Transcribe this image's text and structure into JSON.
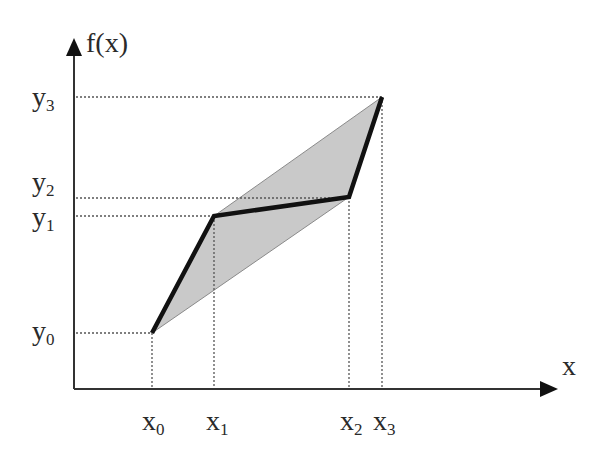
{
  "diagram": {
    "axes": {
      "y_label": "f(x)",
      "x_label": "x"
    },
    "x_ticks": [
      {
        "base": "x",
        "sub": "0",
        "px": 152
      },
      {
        "base": "x",
        "sub": "1",
        "px": 214
      },
      {
        "base": "x",
        "sub": "2",
        "px": 349
      },
      {
        "base": "x",
        "sub": "3",
        "px": 382
      }
    ],
    "y_ticks": [
      {
        "base": "y",
        "sub": "0",
        "py": 333
      },
      {
        "base": "y",
        "sub": "1",
        "py": 216
      },
      {
        "base": "y",
        "sub": "2",
        "py": 198
      },
      {
        "base": "y",
        "sub": "3",
        "py": 97
      }
    ],
    "polyline_points": [
      [
        152,
        333
      ],
      [
        214,
        216
      ],
      [
        349,
        197
      ],
      [
        382,
        97
      ]
    ],
    "shaded_region": [
      [
        152,
        333
      ],
      [
        214,
        216
      ],
      [
        382,
        97
      ],
      [
        349,
        197
      ]
    ],
    "colors": {
      "axis": "#333333",
      "polyline": "#111111",
      "shade": "#c9c9c9",
      "shade_edge": "#8a8a8a",
      "dotted": "#555555"
    }
  }
}
